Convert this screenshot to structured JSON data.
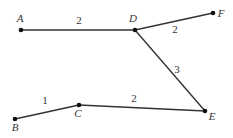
{
  "diagram": {
    "type": "weighted-graph",
    "width": 233,
    "height": 138,
    "colors": {
      "edge": "#333333",
      "node": "#111111",
      "label": "#333333",
      "background": "#ffffff"
    },
    "nodes": [
      {
        "id": "A",
        "label": "A",
        "x": 21,
        "y": 30,
        "label_x": 20,
        "label_y": 22
      },
      {
        "id": "D",
        "label": "D",
        "x": 135,
        "y": 30,
        "label_x": 133,
        "label_y": 22
      },
      {
        "id": "F",
        "label": "F",
        "x": 213,
        "y": 13,
        "label_x": 221,
        "label_y": 17
      },
      {
        "id": "B",
        "label": "B",
        "x": 15,
        "y": 119,
        "label_x": 15,
        "label_y": 131
      },
      {
        "id": "C",
        "label": "C",
        "x": 79,
        "y": 105,
        "label_x": 78,
        "label_y": 117
      },
      {
        "id": "E",
        "label": "E",
        "x": 205,
        "y": 111,
        "label_x": 212,
        "label_y": 120
      }
    ],
    "edges": [
      {
        "from": "A",
        "to": "D",
        "weight": "2",
        "label_x": 79,
        "label_y": 24
      },
      {
        "from": "D",
        "to": "F",
        "weight": "2",
        "label_x": 175,
        "label_y": 33
      },
      {
        "from": "D",
        "to": "E",
        "weight": "3",
        "label_x": 177,
        "label_y": 73
      },
      {
        "from": "B",
        "to": "C",
        "weight": "1",
        "label_x": 45,
        "label_y": 104
      },
      {
        "from": "C",
        "to": "E",
        "weight": "2",
        "label_x": 134,
        "label_y": 102
      }
    ]
  }
}
